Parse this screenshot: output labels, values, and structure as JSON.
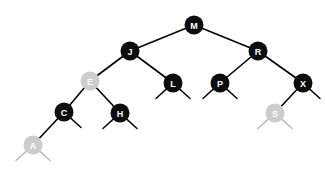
{
  "figure": {
    "background_color": "#ffffff",
    "width": 325,
    "height": 169
  },
  "colors": {
    "black_node": "#0d0d0d",
    "red_node": "#cccccc",
    "edge": "#000000",
    "red_edge": "#b9b9b9",
    "label": "#ffffff"
  },
  "chart_data": {
    "type": "diagram",
    "diagram_kind": "red-black-tree",
    "node_radius": 9.5,
    "nodes": [
      {
        "id": "M",
        "label": "M",
        "color": "black",
        "x": 194,
        "y": 25,
        "depth": 0,
        "left": "J",
        "right": "R"
      },
      {
        "id": "J",
        "label": "J",
        "color": "black",
        "x": 130,
        "y": 51,
        "depth": 1,
        "left": "E",
        "right": "L"
      },
      {
        "id": "R",
        "label": "R",
        "color": "black",
        "x": 258,
        "y": 51,
        "depth": 1,
        "left": "P",
        "right": "X"
      },
      {
        "id": "E",
        "label": "E",
        "color": "red",
        "x": 90,
        "y": 81,
        "depth": 2,
        "left": "C",
        "right": "H"
      },
      {
        "id": "L",
        "label": "L",
        "color": "black",
        "x": 173,
        "y": 83,
        "depth": 2,
        "left": null,
        "right": null
      },
      {
        "id": "P",
        "label": "P",
        "color": "black",
        "x": 220,
        "y": 83,
        "depth": 2,
        "left": null,
        "right": null
      },
      {
        "id": "X",
        "label": "X",
        "color": "black",
        "x": 303,
        "y": 83,
        "depth": 2,
        "left": "S",
        "right": null
      },
      {
        "id": "C",
        "label": "C",
        "color": "black",
        "x": 64,
        "y": 112,
        "depth": 3,
        "left": "A",
        "right": null
      },
      {
        "id": "H",
        "label": "H",
        "color": "black",
        "x": 120,
        "y": 113,
        "depth": 3,
        "left": null,
        "right": null
      },
      {
        "id": "S",
        "label": "S",
        "color": "red",
        "x": 275,
        "y": 113,
        "depth": 3,
        "left": null,
        "right": null
      },
      {
        "id": "A",
        "label": "A",
        "color": "red",
        "x": 33,
        "y": 145,
        "depth": 4,
        "left": null,
        "right": null
      }
    ],
    "edges": [
      {
        "from": "M",
        "to": "J",
        "side": "left",
        "color": "black"
      },
      {
        "from": "M",
        "to": "R",
        "side": "right",
        "color": "black"
      },
      {
        "from": "J",
        "to": "E",
        "side": "left",
        "color": "red"
      },
      {
        "from": "J",
        "to": "L",
        "side": "right",
        "color": "black"
      },
      {
        "from": "R",
        "to": "P",
        "side": "left",
        "color": "black"
      },
      {
        "from": "R",
        "to": "X",
        "side": "right",
        "color": "black"
      },
      {
        "from": "E",
        "to": "C",
        "side": "left",
        "color": "black"
      },
      {
        "from": "E",
        "to": "H",
        "side": "right",
        "color": "black"
      },
      {
        "from": "X",
        "to": "S",
        "side": "left",
        "color": "red"
      },
      {
        "from": "C",
        "to": "A",
        "side": "left",
        "color": "red"
      }
    ],
    "null_stubs": [
      {
        "parent": "L",
        "side": "left",
        "color": "black"
      },
      {
        "parent": "L",
        "side": "right",
        "color": "black"
      },
      {
        "parent": "P",
        "side": "left",
        "color": "black"
      },
      {
        "parent": "P",
        "side": "right",
        "color": "black"
      },
      {
        "parent": "X",
        "side": "right",
        "color": "black"
      },
      {
        "parent": "C",
        "side": "right",
        "color": "black"
      },
      {
        "parent": "H",
        "side": "left",
        "color": "black"
      },
      {
        "parent": "H",
        "side": "right",
        "color": "black"
      },
      {
        "parent": "S",
        "side": "left",
        "color": "red"
      },
      {
        "parent": "S",
        "side": "right",
        "color": "red"
      },
      {
        "parent": "A",
        "side": "left",
        "color": "red"
      },
      {
        "parent": "A",
        "side": "right",
        "color": "red"
      }
    ],
    "stub_length": 15,
    "stub_dx": 11,
    "stub_dy": 10,
    "legend": [],
    "annotations": []
  }
}
